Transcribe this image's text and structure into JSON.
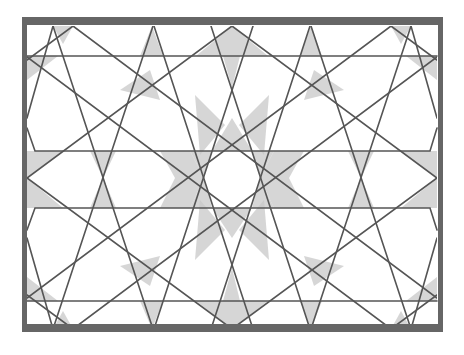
{
  "figure": {
    "background": "#ffffff",
    "colors": {
      "frame": "#666666",
      "line": "#555555",
      "fill_light": "#c8c8c8",
      "fill_dark": "#a0a0a0"
    },
    "frame": {
      "x": 22,
      "y": 17,
      "width": 421,
      "height": 315,
      "stroke_top": 8,
      "stroke_side": 5
    },
    "inner_box": {
      "x1": 27,
      "y1": 26,
      "x2": 437,
      "y2": 329
    },
    "rosette_center": {
      "x": 232,
      "y": 178,
      "inner_radius": 29
    },
    "horizontal_bands": [
      {
        "name": "top-band",
        "points": [
          [
            27,
            56
          ],
          [
            437,
            56
          ]
        ]
      },
      {
        "name": "upper-band",
        "points": [
          [
            27,
            128
          ],
          [
            35,
            151
          ],
          [
            430,
            151
          ],
          [
            437,
            128
          ]
        ]
      },
      {
        "name": "lower-band",
        "points": [
          [
            27,
            230
          ],
          [
            35,
            208
          ],
          [
            430,
            208
          ],
          [
            437,
            230
          ]
        ]
      },
      {
        "name": "bottom-band",
        "points": [
          [
            27,
            301
          ],
          [
            437,
            301
          ]
        ]
      }
    ],
    "steep_lines": [
      [
        [
          53,
          26
        ],
        [
          153,
          329
        ]
      ],
      [
        [
          153,
          26
        ],
        [
          53,
          329
        ]
      ],
      [
        [
          311,
          26
        ],
        [
          411,
          329
        ]
      ],
      [
        [
          411,
          26
        ],
        [
          311,
          329
        ]
      ],
      [
        [
          154,
          26
        ],
        [
          253,
          329
        ]
      ],
      [
        [
          253,
          26
        ],
        [
          154,
          329
        ]
      ],
      [
        [
          211,
          26
        ],
        [
          310,
          329
        ]
      ],
      [
        [
          310,
          26
        ],
        [
          211,
          329
        ]
      ],
      [
        [
          53,
          26
        ],
        [
          27,
          118
        ]
      ],
      [
        [
          411,
          26
        ],
        [
          437,
          118
        ]
      ],
      [
        [
          53,
          329
        ],
        [
          27,
          238
        ]
      ],
      [
        [
          411,
          329
        ],
        [
          437,
          238
        ]
      ]
    ],
    "shallow_lines": [
      [
        [
          232,
          26
        ],
        [
          27,
          178
        ]
      ],
      [
        [
          232,
          26
        ],
        [
          437,
          178
        ]
      ],
      [
        [
          232,
          329
        ],
        [
          27,
          178
        ]
      ],
      [
        [
          232,
          329
        ],
        [
          437,
          178
        ]
      ],
      [
        [
          73,
          26
        ],
        [
          27,
          60
        ]
      ],
      [
        [
          391,
          26
        ],
        [
          437,
          60
        ]
      ],
      [
        [
          73,
          329
        ],
        [
          27,
          295
        ]
      ],
      [
        [
          391,
          329
        ],
        [
          437,
          295
        ]
      ],
      [
        [
          73,
          26
        ],
        [
          437,
          298
        ]
      ],
      [
        [
          391,
          26
        ],
        [
          27,
          298
        ]
      ],
      [
        [
          73,
          329
        ],
        [
          437,
          57
        ]
      ],
      [
        [
          391,
          329
        ],
        [
          27,
          57
        ]
      ]
    ],
    "shaded_regions": [
      [
        [
          232,
          26
        ],
        [
          196,
          56
        ],
        [
          268,
          56
        ]
      ],
      [
        [
          232,
          329
        ],
        [
          196,
          301
        ],
        [
          268,
          301
        ]
      ],
      [
        [
          223,
          56
        ],
        [
          240,
          56
        ],
        [
          232,
          88
        ]
      ],
      [
        [
          223,
          301
        ],
        [
          240,
          301
        ],
        [
          232,
          268
        ]
      ],
      [
        [
          73,
          26
        ],
        [
          53,
          26
        ],
        [
          63,
          44
        ]
      ],
      [
        [
          391,
          26
        ],
        [
          411,
          26
        ],
        [
          401,
          44
        ]
      ],
      [
        [
          73,
          329
        ],
        [
          53,
          329
        ],
        [
          63,
          311
        ]
      ],
      [
        [
          391,
          329
        ],
        [
          411,
          329
        ],
        [
          401,
          311
        ]
      ],
      [
        [
          27,
          178
        ],
        [
          27,
          151
        ],
        [
          63,
          151
        ]
      ],
      [
        [
          27,
          178
        ],
        [
          27,
          208
        ],
        [
          63,
          208
        ]
      ],
      [
        [
          437,
          178
        ],
        [
          437,
          151
        ],
        [
          401,
          151
        ]
      ],
      [
        [
          437,
          178
        ],
        [
          437,
          208
        ],
        [
          401,
          208
        ]
      ],
      [
        [
          152,
          26
        ],
        [
          140,
          56
        ],
        [
          163,
          56
        ]
      ],
      [
        [
          311,
          26
        ],
        [
          300,
          56
        ],
        [
          322,
          56
        ]
      ],
      [
        [
          152,
          329
        ],
        [
          140,
          301
        ],
        [
          163,
          301
        ]
      ],
      [
        [
          311,
          329
        ],
        [
          300,
          301
        ],
        [
          322,
          301
        ]
      ],
      [
        [
          103,
          178
        ],
        [
          90,
          151
        ],
        [
          116,
          151
        ]
      ],
      [
        [
          103,
          178
        ],
        [
          90,
          208
        ],
        [
          116,
          208
        ]
      ],
      [
        [
          361,
          178
        ],
        [
          348,
          151
        ],
        [
          374,
          151
        ]
      ],
      [
        [
          361,
          178
        ],
        [
          348,
          208
        ],
        [
          374,
          208
        ]
      ],
      [
        [
          232,
          118
        ],
        [
          212,
          151
        ],
        [
          252,
          151
        ]
      ],
      [
        [
          232,
          238
        ],
        [
          212,
          208
        ],
        [
          252,
          208
        ]
      ],
      [
        [
          190,
          151
        ],
        [
          212,
          151
        ],
        [
          204,
          178
        ]
      ],
      [
        [
          274,
          151
        ],
        [
          252,
          151
        ],
        [
          260,
          178
        ]
      ],
      [
        [
          190,
          208
        ],
        [
          212,
          208
        ],
        [
          204,
          178
        ]
      ],
      [
        [
          274,
          208
        ],
        [
          252,
          208
        ],
        [
          260,
          178
        ]
      ],
      [
        [
          160,
          151
        ],
        [
          190,
          151
        ],
        [
          204,
          178
        ],
        [
          175,
          178
        ]
      ],
      [
        [
          304,
          151
        ],
        [
          274,
          151
        ],
        [
          260,
          178
        ],
        [
          289,
          178
        ]
      ],
      [
        [
          160,
          208
        ],
        [
          190,
          208
        ],
        [
          204,
          178
        ],
        [
          175,
          178
        ]
      ],
      [
        [
          304,
          208
        ],
        [
          274,
          208
        ],
        [
          260,
          178
        ],
        [
          289,
          178
        ]
      ],
      [
        [
          27,
          56
        ],
        [
          27,
          80
        ],
        [
          58,
          56
        ]
      ],
      [
        [
          437,
          56
        ],
        [
          437,
          80
        ],
        [
          406,
          56
        ]
      ],
      [
        [
          27,
          301
        ],
        [
          27,
          277
        ],
        [
          58,
          301
        ]
      ],
      [
        [
          437,
          301
        ],
        [
          437,
          277
        ],
        [
          406,
          301
        ]
      ],
      [
        [
          120,
          90
        ],
        [
          150,
          70
        ],
        [
          160,
          100
        ]
      ],
      [
        [
          344,
          90
        ],
        [
          314,
          70
        ],
        [
          304,
          100
        ]
      ],
      [
        [
          120,
          266
        ],
        [
          150,
          286
        ],
        [
          160,
          256
        ]
      ],
      [
        [
          344,
          266
        ],
        [
          314,
          286
        ],
        [
          304,
          256
        ]
      ],
      [
        [
          200,
          200
        ],
        [
          225,
          230
        ],
        [
          195,
          260
        ]
      ],
      [
        [
          264,
          200
        ],
        [
          239,
          230
        ],
        [
          269,
          260
        ]
      ],
      [
        [
          200,
          155
        ],
        [
          225,
          125
        ],
        [
          195,
          95
        ]
      ],
      [
        [
          264,
          155
        ],
        [
          239,
          125
        ],
        [
          269,
          95
        ]
      ]
    ]
  }
}
